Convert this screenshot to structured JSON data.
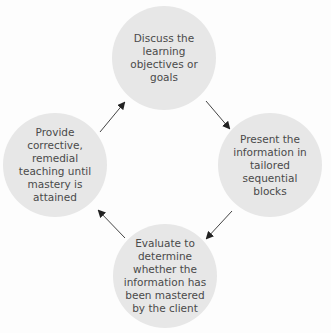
{
  "diagram": {
    "type": "cycle",
    "nodes": [
      {
        "id": "top",
        "label": "Discuss the learning objectives or goals"
      },
      {
        "id": "right",
        "label": "Present the information in tailored sequential blocks"
      },
      {
        "id": "bottom",
        "label": "Evaluate to determine whether the information has been mastered by the client"
      },
      {
        "id": "left",
        "label": "Provide corrective, remedial teaching until mastery is attained"
      }
    ],
    "edges": [
      {
        "from": "top",
        "to": "right"
      },
      {
        "from": "right",
        "to": "bottom"
      },
      {
        "from": "bottom",
        "to": "left"
      },
      {
        "from": "left",
        "to": "top"
      }
    ],
    "colors": {
      "node_fill": "#e7e7e7",
      "text": "#4a4a4a",
      "arrow": "#333333",
      "background": "#fdfdfd"
    }
  }
}
